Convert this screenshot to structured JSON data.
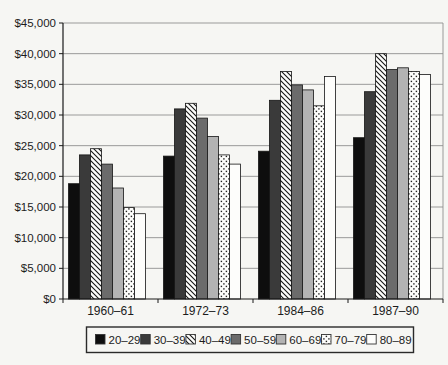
{
  "colors": {
    "paper": "#f6f6f3",
    "grid": "#909090",
    "axis": "#1a1a1a",
    "bar_border": "#141414",
    "text": "#1c1c1c",
    "legend_border": "#2a2a2a",
    "white_fill": "#fdfdfb"
  },
  "chart_data": {
    "type": "bar",
    "title": "",
    "xlabel": "",
    "ylabel": "",
    "categories": [
      "1960–61",
      "1972–73",
      "1984–86",
      "1987–90"
    ],
    "series": [
      {
        "name": "20–29",
        "style": "solid",
        "color": "#0e0e0e",
        "values": [
          18800,
          23300,
          24100,
          26300
        ]
      },
      {
        "name": "30–39",
        "style": "solid",
        "color": "#3a3a3a",
        "values": [
          23500,
          31000,
          32400,
          33800
        ]
      },
      {
        "name": "40–49",
        "style": "hatch",
        "color": "#111111",
        "values": [
          24500,
          31900,
          37100,
          40000
        ]
      },
      {
        "name": "50–59",
        "style": "solid",
        "color": "#6b6b6b",
        "values": [
          22000,
          29500,
          34900,
          37400
        ]
      },
      {
        "name": "60–69",
        "style": "solid",
        "color": "#b3b3b3",
        "values": [
          18100,
          26500,
          34100,
          37700
        ]
      },
      {
        "name": "70–79",
        "style": "dots",
        "color": "#111111",
        "values": [
          14900,
          23500,
          31500,
          37100
        ]
      },
      {
        "name": "80–89",
        "style": "white",
        "color": "#fdfdfb",
        "values": [
          13900,
          22000,
          36300,
          36600
        ]
      }
    ],
    "ylim": [
      0,
      45000
    ],
    "ytick_step": 5000,
    "ytick_labels": [
      "$0",
      "$5,000",
      "$10,000",
      "$15,000",
      "$20,000",
      "$25,000",
      "$30,000",
      "$35,000",
      "$40,000",
      "$45,000"
    ],
    "grid": true,
    "legend_position": "bottom"
  }
}
